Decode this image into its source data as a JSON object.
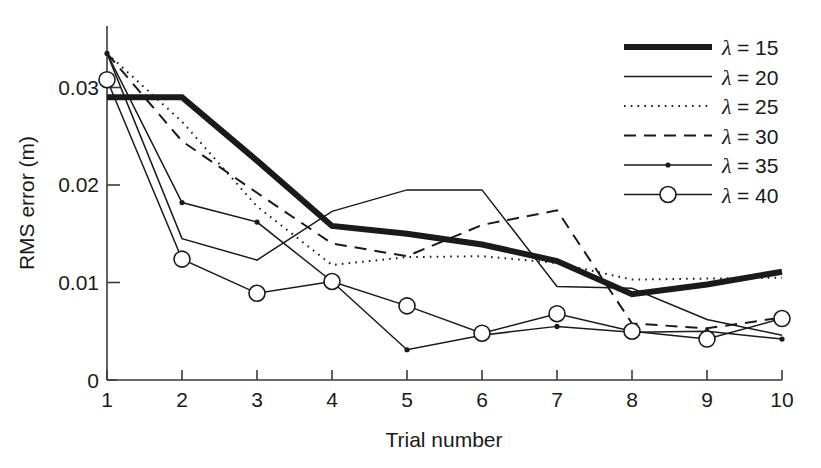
{
  "chart_data": {
    "type": "line",
    "title": "",
    "xlabel": "Trial number",
    "ylabel": "RMS error (m)",
    "x": [
      1,
      2,
      3,
      4,
      5,
      6,
      7,
      8,
      9,
      10
    ],
    "xticklabels": [
      "1",
      "2",
      "3",
      "4",
      "5",
      "6",
      "7",
      "8",
      "9",
      "10"
    ],
    "yticks": [
      0,
      0.01,
      0.02,
      0.03
    ],
    "yticklabels": [
      "0",
      "0.01",
      "0.02",
      "0.03"
    ],
    "xlim": [
      1,
      10
    ],
    "ylim": [
      0,
      0.0355
    ],
    "grid": false,
    "legend_position": "upper right",
    "series": [
      {
        "name": "lambda = 15",
        "legend_lambda": "λ",
        "legend_text": " = 15",
        "style": "thick-solid",
        "marker": "none",
        "values": [
          0.029,
          0.029,
          0.0225,
          0.0158,
          0.015,
          0.0139,
          0.0122,
          0.0088,
          0.0098,
          0.0111
        ]
      },
      {
        "name": "lambda = 20",
        "legend_lambda": "λ",
        "legend_text": " = 20",
        "style": "thin-solid",
        "marker": "none",
        "values": [
          0.0335,
          0.0145,
          0.0123,
          0.0173,
          0.0195,
          0.0195,
          0.0096,
          0.0094,
          0.0062,
          0.0046
        ]
      },
      {
        "name": "lambda = 25",
        "legend_lambda": "λ",
        "legend_text": " = 25",
        "style": "dotted",
        "marker": "none",
        "values": [
          0.0335,
          0.0265,
          0.0178,
          0.0118,
          0.0126,
          0.0127,
          0.012,
          0.0103,
          0.0104,
          0.0105
        ]
      },
      {
        "name": "lambda = 30",
        "legend_lambda": "λ",
        "legend_text": " = 30",
        "style": "dashed",
        "marker": "none",
        "values": [
          0.0335,
          0.0245,
          0.0192,
          0.014,
          0.0127,
          0.0159,
          0.0174,
          0.0058,
          0.0053,
          0.0064
        ]
      },
      {
        "name": "lambda = 35",
        "legend_lambda": "λ",
        "legend_text": " = 35",
        "style": "thin-solid",
        "marker": "dot",
        "values": [
          0.0335,
          0.0182,
          0.0162,
          0.0101,
          0.0031,
          0.0046,
          0.0055,
          0.0049,
          0.005,
          0.0042
        ]
      },
      {
        "name": "lambda = 40",
        "legend_lambda": "λ",
        "legend_text": " = 40",
        "style": "thin-solid",
        "marker": "circle",
        "values": [
          0.0308,
          0.0124,
          0.0089,
          0.0101,
          0.0076,
          0.0048,
          0.0068,
          0.005,
          0.0042,
          0.0063
        ]
      }
    ]
  },
  "axes": {
    "x_title": "Trial number",
    "y_title": "RMS error (m)"
  },
  "colors": {
    "ink": "#1a1a1a",
    "axis": "#3a3a3a",
    "background": "#ffffff"
  }
}
